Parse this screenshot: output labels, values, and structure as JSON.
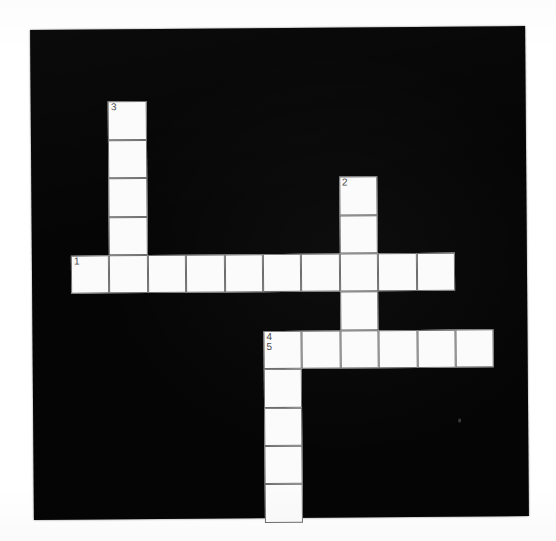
{
  "puzzle": {
    "title": "Crossword Puzzle Grid",
    "type": "crossword-grid",
    "background_color": "#050505",
    "cell_fill_color": "#fbfbfb",
    "cell_border_color": "#6e6e6e",
    "number_color": "#4a4a4a",
    "board": {
      "x": 32,
      "y": 28,
      "width": 495,
      "height": 490,
      "rotation_deg": -0.45
    },
    "geometry": {
      "cell_size": 38.4,
      "origin_x": 39,
      "origin_y": 34
    },
    "grid": {
      "columns": 12,
      "rows": 12
    },
    "entries": [
      {
        "number": "1",
        "direction": "across",
        "length": 10,
        "start_col": 0,
        "start_row": 5
      },
      {
        "number": "2",
        "direction": "down",
        "length": 5,
        "start_col": 7,
        "start_row": 3
      },
      {
        "number": "3",
        "direction": "down",
        "length": 5,
        "start_col": 1,
        "start_row": 1
      },
      {
        "number": "4",
        "direction": "across",
        "length": 6,
        "start_col": 5,
        "start_row": 7
      },
      {
        "number": "5",
        "direction": "down",
        "length": 5,
        "start_col": 5,
        "start_row": 7
      }
    ],
    "cells": [
      {
        "col": 1,
        "row": 1,
        "numbers": [
          "3"
        ]
      },
      {
        "col": 1,
        "row": 2,
        "numbers": []
      },
      {
        "col": 1,
        "row": 3,
        "numbers": []
      },
      {
        "col": 1,
        "row": 4,
        "numbers": []
      },
      {
        "col": 7,
        "row": 3,
        "numbers": [
          "2"
        ]
      },
      {
        "col": 7,
        "row": 4,
        "numbers": []
      },
      {
        "col": 0,
        "row": 5,
        "numbers": [
          "1"
        ]
      },
      {
        "col": 1,
        "row": 5,
        "numbers": []
      },
      {
        "col": 2,
        "row": 5,
        "numbers": []
      },
      {
        "col": 3,
        "row": 5,
        "numbers": []
      },
      {
        "col": 4,
        "row": 5,
        "numbers": []
      },
      {
        "col": 5,
        "row": 5,
        "numbers": []
      },
      {
        "col": 6,
        "row": 5,
        "numbers": []
      },
      {
        "col": 7,
        "row": 5,
        "numbers": []
      },
      {
        "col": 8,
        "row": 5,
        "numbers": []
      },
      {
        "col": 9,
        "row": 5,
        "numbers": []
      },
      {
        "col": 7,
        "row": 6,
        "numbers": []
      },
      {
        "col": 5,
        "row": 7,
        "numbers": [
          "4",
          "5"
        ]
      },
      {
        "col": 6,
        "row": 7,
        "numbers": []
      },
      {
        "col": 7,
        "row": 7,
        "numbers": []
      },
      {
        "col": 8,
        "row": 7,
        "numbers": []
      },
      {
        "col": 9,
        "row": 7,
        "numbers": []
      },
      {
        "col": 10,
        "row": 7,
        "numbers": []
      },
      {
        "col": 5,
        "row": 8,
        "numbers": []
      },
      {
        "col": 5,
        "row": 9,
        "numbers": []
      },
      {
        "col": 5,
        "row": 10,
        "numbers": []
      },
      {
        "col": 5,
        "row": 11,
        "numbers": []
      }
    ]
  }
}
